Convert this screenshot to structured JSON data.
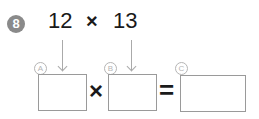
{
  "problem": {
    "number": "8",
    "operand1": "12",
    "operator": "×",
    "operand2": "13"
  },
  "equation": {
    "label_a": "A",
    "label_b": "B",
    "label_c": "C",
    "box_a_value": "",
    "box_b_value": "",
    "box_c_value": "",
    "times_symbol": "×",
    "equals_symbol": "="
  }
}
